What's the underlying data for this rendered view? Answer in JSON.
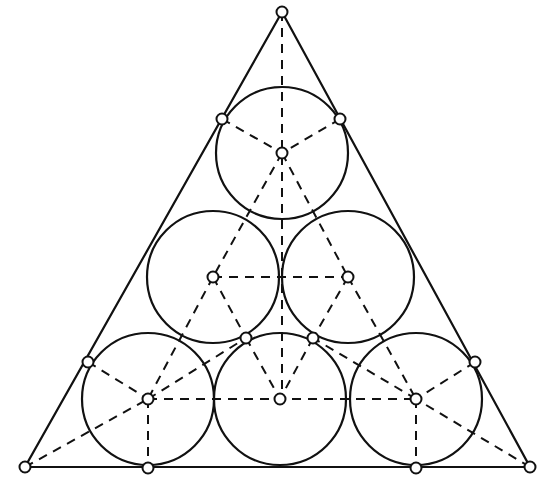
{
  "diagram": {
    "colors": {
      "stroke": "#111111",
      "background": "#ffffff",
      "point_fill": "#ffffff"
    },
    "triangle": {
      "vertices": [
        [
          282,
          12
        ],
        [
          25,
          467
        ],
        [
          530,
          467
        ]
      ]
    },
    "circles": [
      {
        "id": "c-top",
        "cx": 282,
        "cy": 153,
        "r": 66
      },
      {
        "id": "c-mid-left",
        "cx": 213,
        "cy": 277,
        "r": 66
      },
      {
        "id": "c-mid-right",
        "cx": 348,
        "cy": 277,
        "r": 66
      },
      {
        "id": "c-bot-left",
        "cx": 148,
        "cy": 399,
        "r": 66
      },
      {
        "id": "c-bot-mid",
        "cx": 280,
        "cy": 399,
        "r": 66
      },
      {
        "id": "c-bot-right",
        "cx": 416,
        "cy": 399,
        "r": 66
      }
    ],
    "points": [
      [
        282,
        12
      ],
      [
        25,
        467
      ],
      [
        530,
        467
      ],
      [
        222,
        119
      ],
      [
        340,
        119
      ],
      [
        88,
        362
      ],
      [
        475,
        362
      ],
      [
        148,
        468
      ],
      [
        416,
        468
      ],
      [
        246,
        338
      ],
      [
        313,
        338
      ],
      [
        282,
        153
      ],
      [
        213,
        277
      ],
      [
        348,
        277
      ],
      [
        148,
        399
      ],
      [
        280,
        399
      ],
      [
        416,
        399
      ]
    ],
    "dashed_lines": [
      [
        282,
        12,
        282,
        399
      ],
      [
        222,
        119,
        282,
        153
      ],
      [
        340,
        119,
        282,
        153
      ],
      [
        282,
        153,
        213,
        277
      ],
      [
        282,
        153,
        348,
        277
      ],
      [
        213,
        277,
        348,
        277
      ],
      [
        213,
        277,
        148,
        399
      ],
      [
        213,
        277,
        246,
        338
      ],
      [
        348,
        277,
        313,
        338
      ],
      [
        348,
        277,
        416,
        399
      ],
      [
        148,
        399,
        416,
        399
      ],
      [
        25,
        467,
        148,
        399
      ],
      [
        530,
        467,
        416,
        399
      ],
      [
        148,
        399,
        148,
        468
      ],
      [
        416,
        399,
        416,
        468
      ],
      [
        88,
        362,
        148,
        399
      ],
      [
        475,
        362,
        416,
        399
      ],
      [
        148,
        399,
        246,
        338
      ],
      [
        416,
        399,
        313,
        338
      ],
      [
        246,
        338,
        280,
        399
      ],
      [
        313,
        338,
        280,
        399
      ]
    ]
  }
}
